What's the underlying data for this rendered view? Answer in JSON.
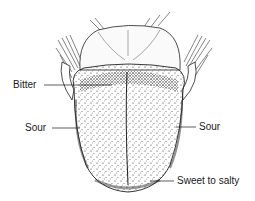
{
  "diagram": {
    "labels": {
      "bitter": "Bitter",
      "sour_left": "Sour",
      "sour_right": "Sour",
      "sweet": "Sweet to salty"
    },
    "colors": {
      "ink": "#1a1a1a",
      "background": "#ffffff"
    }
  }
}
